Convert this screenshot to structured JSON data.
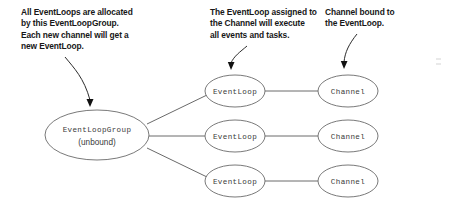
{
  "diagram": {
    "background_color": "#ffffff",
    "node_stroke_color": "#6a6a6a",
    "caption_color": "#171717",
    "node_text_color": "#3a3a3a",
    "leader_color": "#111111"
  },
  "captions": [
    {
      "id": "eventloopgroup",
      "text": "All EventLoops are allocated\nby this EventLoopGroup.\nEach new channel will get a\nnew EventLoop.",
      "lines": [
        "All EventLoops are allocated",
        "by this EventLoopGroup.",
        "Each new channel will get a",
        "new EventLoop."
      ]
    },
    {
      "id": "eventloop",
      "text": "The EventLoop assigned to\nthe Channel will execute\nall events and tasks.",
      "lines": [
        "The EventLoop assigned to",
        "the Channel will execute",
        "all events and tasks."
      ]
    },
    {
      "id": "channel",
      "text": "Channel bound to\nthe EventLoop.",
      "lines": [
        "Channel bound to",
        "the EventLoop."
      ]
    }
  ],
  "nodes": {
    "group": {
      "label": "EventLoopGroup",
      "sublabel": "(unbound)",
      "cx": 97,
      "cy": 135,
      "rx": 52,
      "ry": 25
    },
    "eventloops": [
      {
        "label": "EventLoop",
        "cx": 235,
        "cy": 91,
        "rx": 30,
        "ry": 16
      },
      {
        "label": "EventLoop",
        "cx": 235,
        "cy": 136,
        "rx": 30,
        "ry": 16
      },
      {
        "label": "EventLoop",
        "cx": 235,
        "cy": 181,
        "rx": 30,
        "ry": 16
      }
    ],
    "channels": [
      {
        "label": "Channel",
        "cx": 348,
        "cy": 91,
        "rx": 30,
        "ry": 16
      },
      {
        "label": "Channel",
        "cx": 348,
        "cy": 136,
        "rx": 30,
        "ry": 16
      },
      {
        "label": "Channel",
        "cx": 348,
        "cy": 181,
        "rx": 30,
        "ry": 16
      }
    ]
  },
  "edges": [
    {
      "from": "group",
      "to": "eventloop-1"
    },
    {
      "from": "group",
      "to": "eventloop-2"
    },
    {
      "from": "group",
      "to": "eventloop-3"
    },
    {
      "from": "eventloop-1",
      "to": "channel-1"
    },
    {
      "from": "eventloop-2",
      "to": "channel-2"
    },
    {
      "from": "eventloop-3",
      "to": "channel-3"
    }
  ],
  "leaders": [
    {
      "id": "leader-to-group",
      "from_caption": "eventloopgroup",
      "to_node": "group"
    },
    {
      "id": "leader-to-eventloop",
      "from_caption": "eventloop",
      "to_node": "eventloop-1"
    },
    {
      "id": "leader-to-channel",
      "from_caption": "channel",
      "to_node": "channel-1"
    }
  ]
}
